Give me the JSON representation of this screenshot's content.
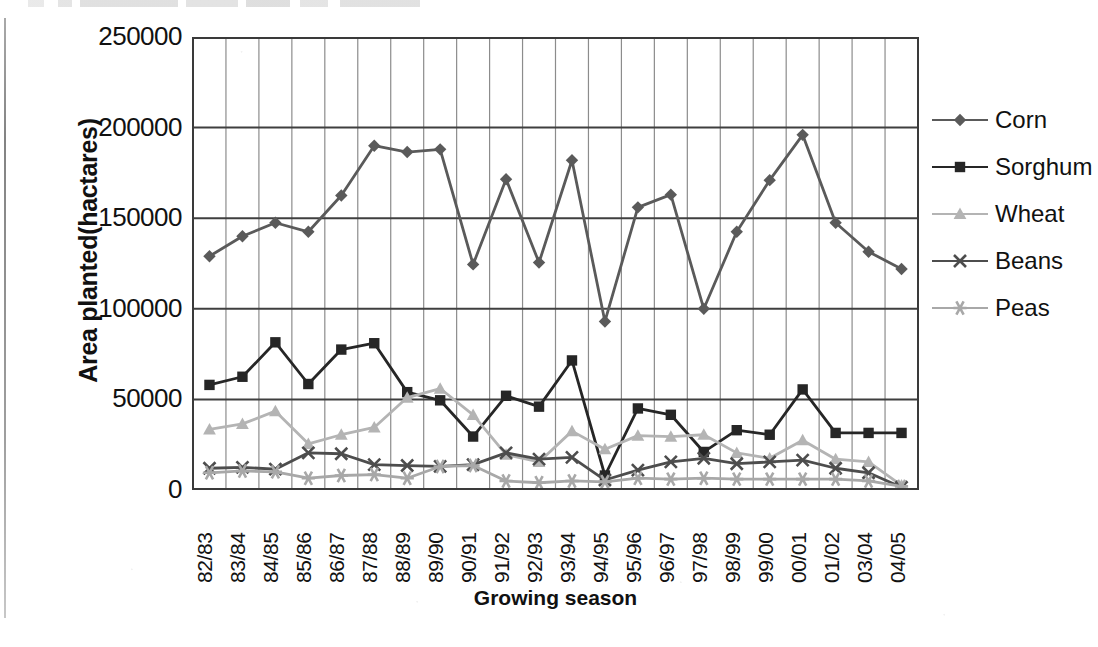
{
  "chart_data": {
    "type": "line",
    "title": "",
    "xlabel": "Growing season",
    "ylabel": "Area planted(hactares)",
    "ylim": [
      0,
      250000
    ],
    "ytick_labels": [
      "250000",
      "200000",
      "150000",
      "100000",
      "50000",
      "0"
    ],
    "ytick_values": [
      250000,
      200000,
      150000,
      100000,
      50000,
      0
    ],
    "grid": true,
    "legend_position": "right",
    "categories": [
      "82/83",
      "83/84",
      "84/85",
      "85/86",
      "86/87",
      "87/88",
      "88/89",
      "89/90",
      "90/91",
      "91/92",
      "92/93",
      "93/94",
      "94/95",
      "95/96",
      "96/97",
      "97/98",
      "98/99",
      "99/00",
      "00/01",
      "01/02",
      "03/04",
      "04/05"
    ],
    "series": [
      {
        "name": "Corn",
        "marker": "diamond",
        "color": "#5a5a5a",
        "values": [
          129000,
          140000,
          147500,
          142500,
          162500,
          190000,
          186500,
          188000,
          124500,
          171500,
          125500,
          182000,
          93000,
          156000,
          163000,
          100000,
          142500,
          171000,
          196000,
          147500,
          131500,
          122000
        ]
      },
      {
        "name": "Sorghum",
        "marker": "square",
        "color": "#262626",
        "values": [
          58000,
          62500,
          81500,
          58500,
          77500,
          81000,
          54000,
          49500,
          29500,
          52000,
          46000,
          71500,
          8000,
          45000,
          41500,
          21000,
          33000,
          30500,
          55500,
          31500,
          31500,
          31500
        ]
      },
      {
        "name": "Wheat",
        "marker": "triangle",
        "color": "#b4b4b4",
        "values": [
          33500,
          36500,
          43500,
          25500,
          30500,
          34500,
          51000,
          56000,
          41500,
          19500,
          15500,
          32500,
          22500,
          30000,
          29500,
          30500,
          20500,
          17500,
          27500,
          17000,
          15500,
          2500
        ]
      },
      {
        "name": "Beans",
        "marker": "cross",
        "color": "#4d4d4d",
        "values": [
          12000,
          12500,
          11500,
          20500,
          20000,
          14000,
          13500,
          13000,
          14000,
          20500,
          17000,
          18000,
          5500,
          11000,
          15500,
          17500,
          14500,
          15500,
          16500,
          12000,
          9500,
          1500
        ]
      },
      {
        "name": "Peas",
        "marker": "asterisk",
        "color": "#a8a8a8",
        "values": [
          9500,
          10500,
          10000,
          6500,
          8000,
          8500,
          6500,
          13000,
          13500,
          5000,
          4000,
          5000,
          4500,
          6500,
          6000,
          6500,
          6000,
          6000,
          6000,
          6000,
          5000,
          2000
        ]
      }
    ]
  },
  "legend": {
    "items": [
      {
        "label": "Corn"
      },
      {
        "label": "Sorghum"
      },
      {
        "label": "Wheat"
      },
      {
        "label": "Beans"
      },
      {
        "label": "Peas"
      }
    ]
  }
}
